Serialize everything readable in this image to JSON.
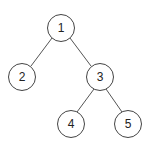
{
  "diagram": {
    "type": "binary-tree",
    "colors": {
      "stroke": "#444444",
      "fill": "#ffffff",
      "text": "#222222"
    },
    "nodes": [
      {
        "id": "n1",
        "label": "1",
        "x": 61,
        "y": 28
      },
      {
        "id": "n2",
        "label": "2",
        "x": 22,
        "y": 77
      },
      {
        "id": "n3",
        "label": "3",
        "x": 100,
        "y": 77
      },
      {
        "id": "n4",
        "label": "4",
        "x": 71,
        "y": 124
      },
      {
        "id": "n5",
        "label": "5",
        "x": 128,
        "y": 124
      }
    ],
    "edges": [
      {
        "from": "1",
        "to": "2"
      },
      {
        "from": "1",
        "to": "3"
      },
      {
        "from": "3",
        "to": "4"
      },
      {
        "from": "3",
        "to": "5"
      }
    ]
  }
}
